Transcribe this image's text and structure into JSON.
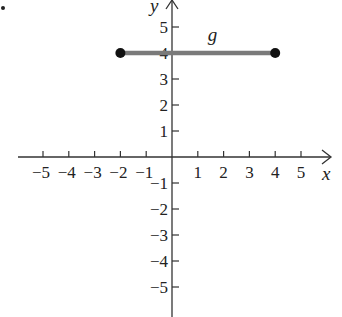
{
  "chart_data": {
    "type": "line",
    "title": "",
    "xlabel": "x",
    "ylabel": "y",
    "xlim": [
      -5.5,
      5.5
    ],
    "ylim": [
      -5.5,
      5.5
    ],
    "grid": false,
    "x_ticks": [
      -5,
      -4,
      -3,
      -2,
      -1,
      1,
      2,
      3,
      4,
      5
    ],
    "y_ticks": [
      -5,
      -4,
      -3,
      -2,
      -1,
      1,
      2,
      3,
      4,
      5
    ],
    "x_tick_labels": [
      "−5",
      "−4",
      "−3",
      "−2",
      "−1",
      "1",
      "2",
      "3",
      "4",
      "5"
    ],
    "y_tick_labels": [
      "−5",
      "−4",
      "−3",
      "−2",
      "−1",
      "1",
      "2",
      "3",
      "4",
      "5"
    ],
    "series": [
      {
        "name": "g",
        "x": [
          -2,
          4
        ],
        "y": [
          4,
          4
        ],
        "endpoints": "closed",
        "color": "#7a7a7a"
      }
    ],
    "annotations": [
      {
        "text": "g",
        "x": 1.0,
        "y": 4.6
      }
    ]
  },
  "layout": {
    "origin_px": [
      172,
      157
    ],
    "unit_x_px": 25.8,
    "unit_y_px": 26,
    "axis_color": "#333333",
    "point_color": "#111111"
  }
}
